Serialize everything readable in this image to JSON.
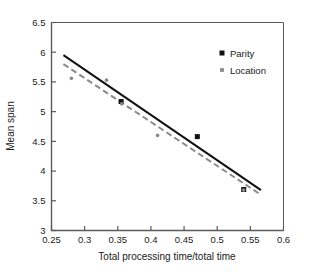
{
  "chart_data": {
    "type": "scatter",
    "title": "",
    "xlabel": "Total processing time/total time",
    "ylabel": "Mean span",
    "xlim": [
      0.25,
      0.6
    ],
    "ylim": [
      3,
      6.5
    ],
    "xticks": [
      0.25,
      0.3,
      0.35,
      0.4,
      0.45,
      0.5,
      0.55,
      0.6
    ],
    "xtick_labels": [
      "0.25",
      "0.3",
      "0.35",
      "0.4",
      "0.45",
      "0.5",
      "0.55",
      "0.6"
    ],
    "yticks": [
      3,
      3.5,
      4,
      4.5,
      5,
      5.5,
      6,
      6.5
    ],
    "ytick_labels": [
      "3",
      "3.5",
      "4",
      "4.5",
      "5",
      "5.5",
      "6",
      "6.5"
    ],
    "grid": false,
    "legend_position": "top-right",
    "series": [
      {
        "name": "Parity",
        "marker": "square",
        "color": "#111111",
        "marker_size": 5.0,
        "points": [
          {
            "x": 0.355,
            "y": 5.17
          },
          {
            "x": 0.47,
            "y": 4.58
          },
          {
            "x": 0.54,
            "y": 3.69
          }
        ],
        "fit_line": {
          "style": "solid",
          "color": "#111111",
          "width": 2.0,
          "x1": 0.268,
          "y1": 5.95,
          "x2": 0.566,
          "y2": 3.68
        }
      },
      {
        "name": "Location",
        "marker": "circle",
        "color": "#8a8a8a",
        "marker_size": 3.6,
        "points": [
          {
            "x": 0.28,
            "y": 5.56
          },
          {
            "x": 0.333,
            "y": 5.53
          },
          {
            "x": 0.356,
            "y": 5.13
          },
          {
            "x": 0.41,
            "y": 4.6
          },
          {
            "x": 0.54,
            "y": 3.68
          }
        ],
        "fit_line": {
          "style": "dashed",
          "color": "#8a8a8a",
          "width": 2.0,
          "x1": 0.268,
          "y1": 5.8,
          "x2": 0.566,
          "y2": 3.6
        }
      }
    ]
  },
  "legend": {
    "items": [
      {
        "label": "Parity",
        "swatch": "black-square-marker"
      },
      {
        "label": "Location",
        "swatch": "gray-square-marker"
      }
    ]
  },
  "axes": {
    "x_title": "Total processing time/total time",
    "y_title": "Mean span"
  },
  "colors": {
    "parity": "#111111",
    "location": "#8a8a8a",
    "frame": "#5a5a5a",
    "background": "#ffffff"
  }
}
